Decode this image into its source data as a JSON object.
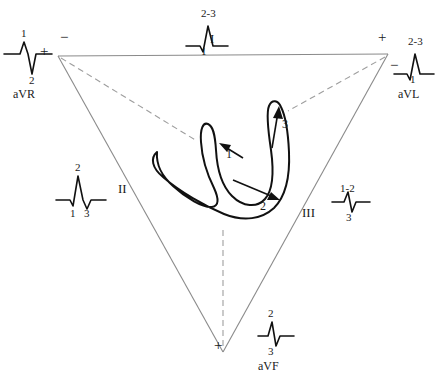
{
  "figure": {
    "type": "einthoven-triangle-vector-loop",
    "line_color": "#8a8a8a",
    "dashed_color": "#9a9a9a",
    "loop_color": "#111111",
    "text_color": "#1a1a1a"
  },
  "triangle": {
    "vertices": [
      {
        "name": "left-arm",
        "x": 58,
        "y": 56
      },
      {
        "name": "right-arm",
        "x": 388,
        "y": 54
      },
      {
        "name": "foot",
        "x": 223,
        "y": 352
      }
    ],
    "sides": [
      {
        "name": "lead-I",
        "label": "I",
        "label_x": 214,
        "label_y": 38
      },
      {
        "name": "lead-II",
        "label": "II",
        "label_x": 121,
        "label_y": 188
      },
      {
        "name": "lead-III",
        "label": "III",
        "label_x": 305,
        "label_y": 212
      }
    ]
  },
  "polarity_signs": [
    {
      "name": "lead-I-negative",
      "symbol": "−",
      "x": 63,
      "y": 38
    },
    {
      "name": "lead-I-positive",
      "symbol": "+",
      "x": 381,
      "y": 38
    },
    {
      "name": "aVR-positive",
      "symbol": "+",
      "x": 44,
      "y": 52
    },
    {
      "name": "aVL-negative",
      "symbol": "−",
      "x": 392,
      "y": 64
    },
    {
      "name": "aVF-positive",
      "symbol": "+",
      "x": 216,
      "y": 345
    }
  ],
  "vector_loop": {
    "description": "QRS vector loop traced counterclockwise with three instantaneous vectors",
    "arrows": [
      {
        "label": "1",
        "label_x": 228,
        "label_y": 152,
        "direction": "left-down"
      },
      {
        "label": "2",
        "label_x": 262,
        "label_y": 203,
        "direction": "right-down"
      },
      {
        "label": "3",
        "label_x": 283,
        "label_y": 122,
        "direction": "up"
      }
    ]
  },
  "dashed_projections": [
    {
      "name": "from-left-arm",
      "from": [
        60,
        58
      ],
      "to": [
        196,
        140
      ]
    },
    {
      "name": "from-right-arm",
      "from": [
        386,
        56
      ],
      "to": [
        288,
        110
      ]
    },
    {
      "name": "from-foot",
      "from": [
        223,
        228
      ],
      "to": [
        223,
        348
      ]
    }
  ],
  "ecg_traces": [
    {
      "name": "aVR",
      "lead_label": "aVR",
      "labels_above": [
        "1"
      ],
      "labels_below": [
        "2"
      ],
      "morphology": "small positive deflection then deep negative deflection",
      "x": 8,
      "y": 36
    },
    {
      "name": "I",
      "lead_label": "I",
      "labels_above": [
        "2-3"
      ],
      "labels_below": [
        "1"
      ],
      "morphology": "small negative notch then tall positive deflection",
      "x": 182,
      "y": 4
    },
    {
      "name": "aVL",
      "lead_label": "aVL",
      "labels_above": [
        "2-3"
      ],
      "labels_below": [
        "1"
      ],
      "morphology": "small negative notch then tall positive deflection",
      "x": 392,
      "y": 36
    },
    {
      "name": "II",
      "lead_label": "",
      "labels_above": [
        "2"
      ],
      "labels_below": [
        "1",
        "3"
      ],
      "morphology": "tall positive deflection flanked by small negatives",
      "x": 56,
      "y": 160
    },
    {
      "name": "III",
      "lead_label": "",
      "labels_above": [
        "1-2"
      ],
      "labels_below": [
        "3"
      ],
      "morphology": "small positive deflection then negative deflection",
      "x": 330,
      "y": 180
    },
    {
      "name": "aVF",
      "lead_label": "aVF",
      "labels_above": [
        "2"
      ],
      "labels_below": [
        "3"
      ],
      "morphology": "positive deflection then negative deflection",
      "x": 256,
      "y": 318
    }
  ]
}
